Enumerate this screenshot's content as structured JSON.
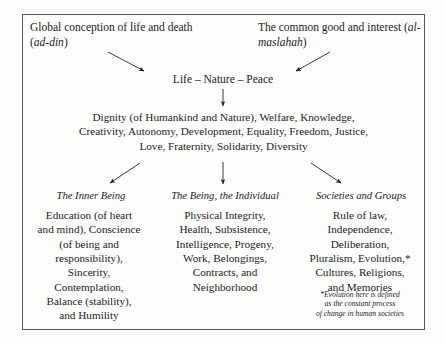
{
  "figure": {
    "type": "hierarchical-flow-diagram",
    "border_color": "#5b5b5b",
    "background_color": "#fdfdfb",
    "text_color": "#1b1b1b"
  },
  "top": {
    "left_concept": "Global conception of life and death (ad-din)",
    "left_concept_plain": "Global conception of life and death (",
    "left_concept_italic": "ad-din",
    "left_concept_tail": ")",
    "right_concept": "The common good and interest (al-maslahah)",
    "right_concept_plain": "The common good and interest (",
    "right_concept_italic": "al-maslahah",
    "right_concept_tail": ")"
  },
  "middle": {
    "life_nature_peace": "Life – Nature – Peace",
    "dignity_block": "Dignity (of Humankind and Nature), Welfare, Knowledge, Creativity, Autonomy, Development, Equality, Freedom, Justice, Love, Fraternity, Solidarity, Diversity",
    "dignity_lines": [
      "Dignity (of Humankind and Nature), Welfare, Knowledge,",
      "Creativity, Autonomy, Development, Equality, Freedom, Justice,",
      "Love, Fraternity, Solidarity, Diversity"
    ]
  },
  "columns": [
    {
      "header": "The Inner Being",
      "body": "Education (of heart and mind), Conscience (of being and responsibility), Sincerity, Contemplation, Balance (stability), and Humility",
      "lines": [
        "Education (of heart",
        "and mind), Conscience",
        "(of being and",
        "responsibility),",
        "Sincerity,",
        "Contemplation,",
        "Balance (stability),",
        "and Humility"
      ]
    },
    {
      "header": "The Being, the Individual",
      "body": "Physical Integrity, Health, Subsistence, Intelligence, Progeny, Work, Belongings, Contracts, and Neighborhood",
      "lines": [
        "Physical Integrity,",
        "Health, Subsistence,",
        "Intelligence, Progeny,",
        "Work, Belongings,",
        "Contracts, and",
        "Neighborhood"
      ]
    },
    {
      "header": "Societies and Groups",
      "body": "Rule of law, Independence, Deliberation, Pluralism, Evolution,* Cultures, Religions, and Memories",
      "lines": [
        "Rule of law,",
        "Independence,",
        "Deliberation,",
        "Pluralism, Evolution,*",
        "Cultures, Religions,",
        "and Memories"
      ]
    }
  ],
  "footnote": {
    "text": "*Evolution here is defined as the constant process of change in human societies",
    "lines": [
      "*Evolution here is defined",
      "as the constant process",
      "of change in human societies"
    ]
  },
  "arrows": [
    {
      "name": "arrow-left-concept-to-life",
      "direction": "down-right"
    },
    {
      "name": "arrow-right-concept-to-life",
      "direction": "down-left"
    },
    {
      "name": "arrow-life-to-dignity",
      "direction": "down"
    },
    {
      "name": "arrow-dignity-to-inner-being",
      "direction": "down-left"
    },
    {
      "name": "arrow-dignity-to-individual",
      "direction": "down"
    },
    {
      "name": "arrow-dignity-to-societies",
      "direction": "down-right"
    }
  ]
}
